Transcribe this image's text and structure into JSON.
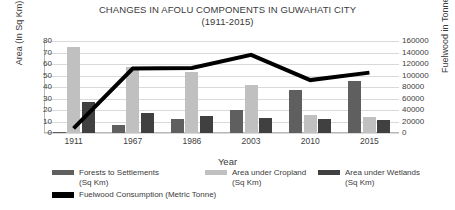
{
  "chart_data": {
    "type": "bar",
    "title": "CHANGES IN AFOLU COMPONENTS IN GUWAHATI CITY",
    "subtitle": "(1911-2015)",
    "xlabel": "Year",
    "ylabel": "Area (In Sq Km)",
    "y2label": "Fuelwood in Tonnes",
    "categories": [
      "1911",
      "1967",
      "1986",
      "2003",
      "2010",
      "2015"
    ],
    "ylim": [
      0,
      80
    ],
    "yticks": [
      "0",
      "10",
      "20",
      "30",
      "40",
      "50",
      "60",
      "70",
      "80"
    ],
    "y2lim": [
      0,
      160000
    ],
    "y2ticks": [
      "0",
      "20000",
      "40000",
      "60000",
      "80000",
      "100000",
      "120000",
      "140000",
      "160000"
    ],
    "grid": true,
    "legend_position": "bottom",
    "series": [
      {
        "name": "Forests to Settlements (Sq Km)",
        "type": "bar",
        "axis": "left",
        "color": "#5f5f5f",
        "values": [
          1,
          7,
          12,
          20,
          37,
          45
        ]
      },
      {
        "name": "Area under Cropland (Sq Km)",
        "type": "bar",
        "axis": "left",
        "color": "#c0c0c0",
        "values": [
          75,
          57,
          53,
          42,
          16,
          14
        ]
      },
      {
        "name": "Area under Wetlands (Sq Km)",
        "type": "bar",
        "axis": "left",
        "color": "#404040",
        "values": [
          27,
          17,
          15,
          13,
          12,
          11
        ]
      },
      {
        "name": "Fuelwood Consumption (Metric Tonne)",
        "type": "line",
        "axis": "right",
        "color": "#000000",
        "values": [
          8000,
          112000,
          113000,
          136000,
          92000,
          105000
        ]
      }
    ]
  },
  "legend": {
    "items": [
      {
        "label_line1": "Forests to Settlements",
        "label_line2": "(Sq Km)",
        "color": "#5f5f5f"
      },
      {
        "label_line1": "Area under Cropland",
        "label_line2": "(Sq Km)",
        "color": "#c0c0c0"
      },
      {
        "label_line1": "Area under Wetlands",
        "label_line2": "(Sq Km)",
        "color": "#404040"
      },
      {
        "label_line1": "Fuelwood Consumption (Metric Tonne)",
        "label_line2": "",
        "color": "#000000"
      }
    ]
  }
}
